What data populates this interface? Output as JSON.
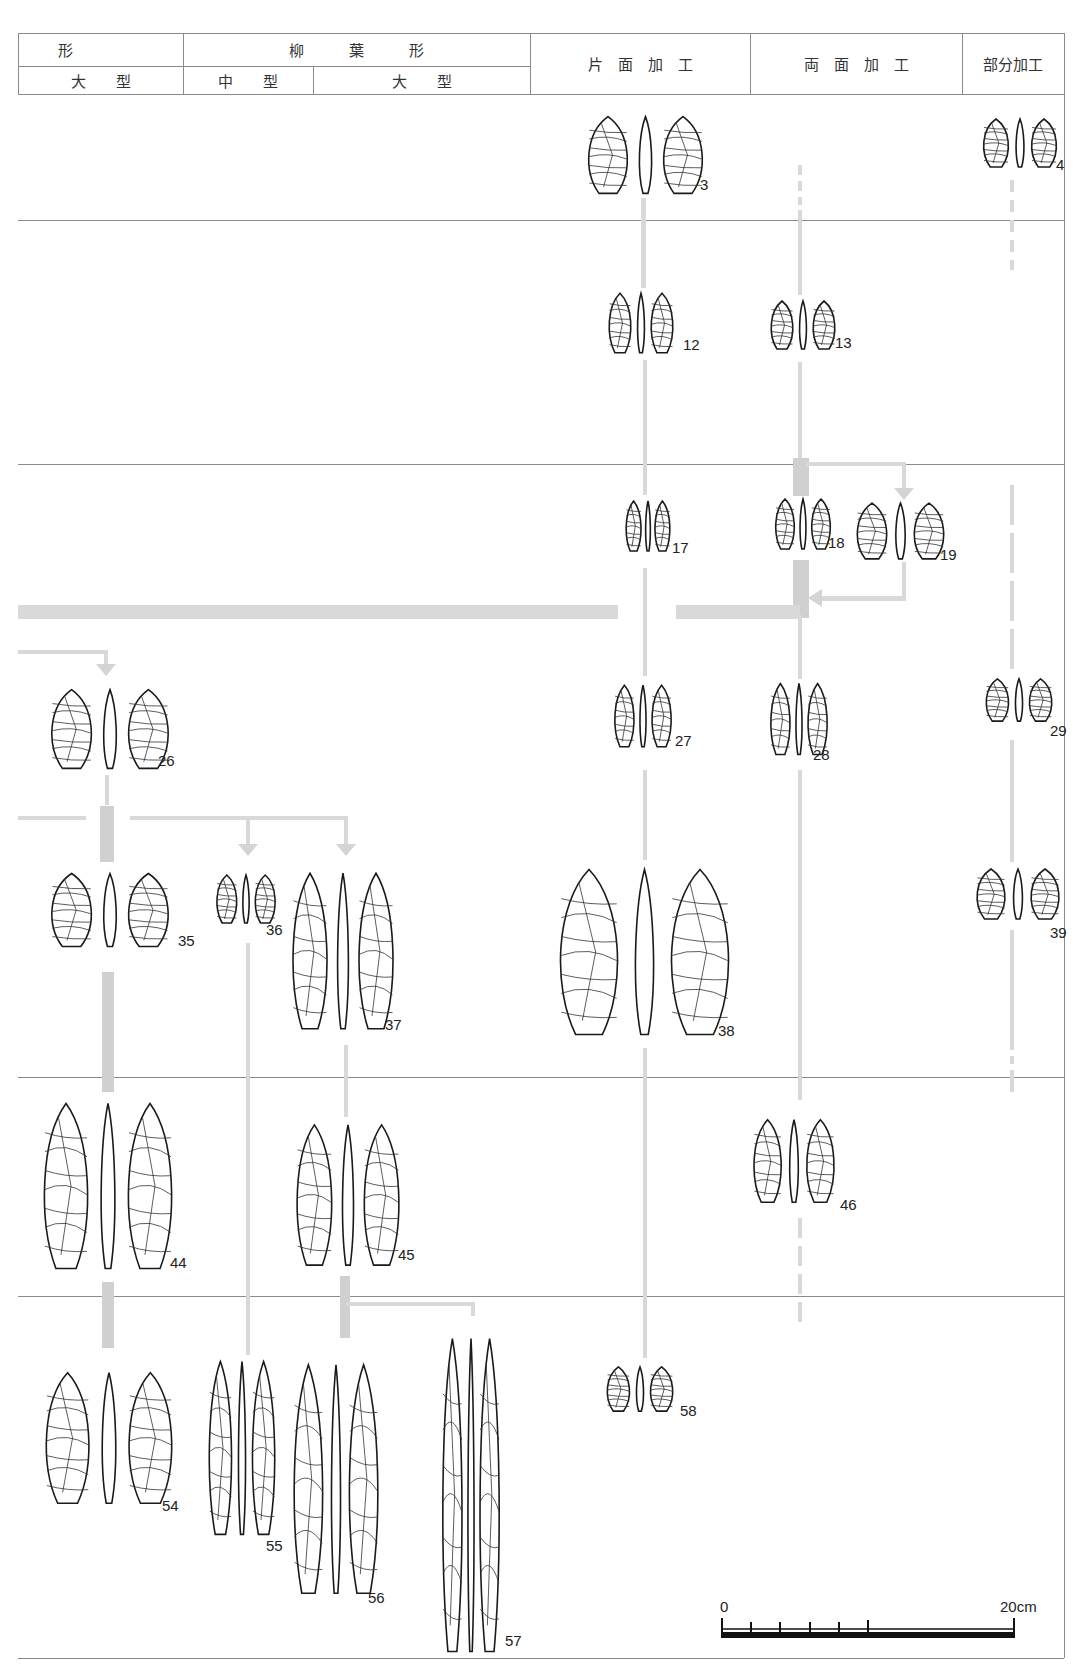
{
  "header": {
    "row1": [
      {
        "label": "形",
        "x": 18,
        "w": 165
      },
      {
        "label": "柳　　　葉　　　形",
        "x": 183,
        "w": 347
      },
      {
        "label": "片　面　加　工",
        "x": 530,
        "w": 220
      },
      {
        "label": "両　面　加　工",
        "x": 750,
        "w": 212
      },
      {
        "label": "部分加工",
        "x": 962,
        "w": 102
      }
    ],
    "row2": [
      {
        "label": "大　　型",
        "x": 18,
        "w": 165
      },
      {
        "label": "中　　型",
        "x": 183,
        "w": 130
      },
      {
        "label": "大　　型",
        "x": 313,
        "w": 217
      }
    ]
  },
  "artifacts": [
    {
      "id": "3",
      "label": "3",
      "x": 583,
      "y": 115,
      "w": 125,
      "h": 80,
      "lx": 700,
      "ly": 192
    },
    {
      "id": "4",
      "label": "4",
      "x": 980,
      "y": 118,
      "w": 80,
      "h": 50,
      "lx": 1056,
      "ly": 172
    },
    {
      "id": "12",
      "label": "12",
      "x": 606,
      "y": 292,
      "w": 70,
      "h": 62,
      "lx": 683,
      "ly": 352
    },
    {
      "id": "13",
      "label": "13",
      "x": 768,
      "y": 300,
      "w": 70,
      "h": 50,
      "lx": 835,
      "ly": 350
    },
    {
      "id": "17",
      "label": "17",
      "x": 624,
      "y": 500,
      "w": 48,
      "h": 52,
      "lx": 672,
      "ly": 555
    },
    {
      "id": "18",
      "label": "18",
      "x": 773,
      "y": 498,
      "w": 60,
      "h": 52,
      "lx": 828,
      "ly": 550
    },
    {
      "id": "19",
      "label": "19",
      "x": 853,
      "y": 502,
      "w": 95,
      "h": 58,
      "lx": 940,
      "ly": 562
    },
    {
      "id": "26",
      "label": "26",
      "x": 46,
      "y": 688,
      "w": 128,
      "h": 82,
      "lx": 158,
      "ly": 768
    },
    {
      "id": "27",
      "label": "27",
      "x": 612,
      "y": 684,
      "w": 62,
      "h": 64,
      "lx": 675,
      "ly": 748
    },
    {
      "id": "28",
      "label": "28",
      "x": 768,
      "y": 682,
      "w": 62,
      "h": 74,
      "lx": 813,
      "ly": 762
    },
    {
      "id": "29",
      "label": "29",
      "x": 983,
      "y": 678,
      "w": 72,
      "h": 44,
      "lx": 1050,
      "ly": 738
    },
    {
      "id": "35",
      "label": "35",
      "x": 46,
      "y": 872,
      "w": 128,
      "h": 76,
      "lx": 178,
      "ly": 948
    },
    {
      "id": "36",
      "label": "36",
      "x": 214,
      "y": 874,
      "w": 64,
      "h": 50,
      "lx": 266,
      "ly": 937
    },
    {
      "id": "37",
      "label": "37",
      "x": 288,
      "y": 870,
      "w": 110,
      "h": 162,
      "lx": 385,
      "ly": 1032
    },
    {
      "id": "38",
      "label": "38",
      "x": 552,
      "y": 866,
      "w": 185,
      "h": 172,
      "lx": 718,
      "ly": 1038
    },
    {
      "id": "39",
      "label": "39",
      "x": 973,
      "y": 868,
      "w": 90,
      "h": 52,
      "lx": 1050,
      "ly": 940
    },
    {
      "id": "44",
      "label": "44",
      "x": 38,
      "y": 1100,
      "w": 140,
      "h": 172,
      "lx": 170,
      "ly": 1270
    },
    {
      "id": "45",
      "label": "45",
      "x": 292,
      "y": 1122,
      "w": 112,
      "h": 146,
      "lx": 398,
      "ly": 1262
    },
    {
      "id": "46",
      "label": "46",
      "x": 750,
      "y": 1118,
      "w": 88,
      "h": 86,
      "lx": 840,
      "ly": 1212
    },
    {
      "id": "54",
      "label": "54",
      "x": 40,
      "y": 1370,
      "w": 138,
      "h": 136,
      "lx": 162,
      "ly": 1513
    },
    {
      "id": "55",
      "label": "55",
      "x": 206,
      "y": 1358,
      "w": 72,
      "h": 180,
      "lx": 266,
      "ly": 1553
    },
    {
      "id": "56",
      "label": "56",
      "x": 290,
      "y": 1360,
      "w": 92,
      "h": 238,
      "lx": 368,
      "ly": 1605
    },
    {
      "id": "57",
      "label": "57",
      "x": 440,
      "y": 1332,
      "w": 62,
      "h": 326,
      "lx": 505,
      "ly": 1648
    },
    {
      "id": "58",
      "label": "58",
      "x": 604,
      "y": 1366,
      "w": 72,
      "h": 46,
      "lx": 680,
      "ly": 1418
    }
  ],
  "scale_bar": {
    "start_label": "0",
    "end_label": "20cm",
    "ticks": 6
  }
}
